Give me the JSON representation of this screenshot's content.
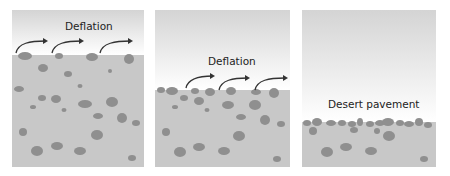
{
  "figure": {
    "panels": [
      {
        "id": 1,
        "label": "Deflation",
        "stage": "initial"
      },
      {
        "id": 2,
        "label": "Deflation",
        "stage": "lowered surface"
      },
      {
        "id": 3,
        "label": "Desert pavement",
        "stage": "final"
      }
    ],
    "colors": {
      "sky_top": "#d4d4d4",
      "ground": "#c8c8c8",
      "pebble": "#8f8f8f",
      "arrow": "#333333"
    }
  }
}
